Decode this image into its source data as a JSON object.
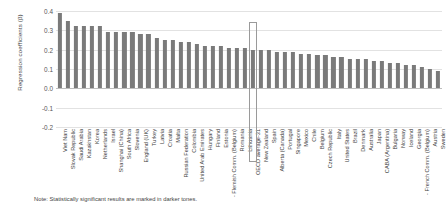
{
  "chart_data": {
    "type": "bar",
    "title": "",
    "xlabel": "",
    "ylabel": "Regression coefficients (β)",
    "ylim": [
      -0.2,
      0.4
    ],
    "ytick_labels": [
      "0.4",
      "0.3",
      "0.2",
      "0.1",
      "0.0",
      "-0.1",
      "-0.2"
    ],
    "ytick_values": [
      0.4,
      0.3,
      0.2,
      0.1,
      0.0,
      -0.1,
      -0.2
    ],
    "grid": true,
    "legend": "none",
    "highlighted_category": "OECD average-31",
    "bar_color": "#7a7a7a",
    "bar_color_light": "#b9b9b9",
    "categories": [
      "Viet Nam",
      "Slovak Republic",
      "Saudi Arabia",
      "Kazakhstan",
      "Korea",
      "Netherlands",
      "Israel",
      "Shanghai (China)",
      "South Africa",
      "Slovenia",
      "England (UK)",
      "Turkey",
      "Latvia",
      "Croatia",
      "Malta",
      "Russian Federation",
      "Colombia",
      "United Arab Emirates",
      "Hungary",
      "Finland",
      "Estonia",
      "- Flemish Comm. (Belgium)",
      "Romania",
      "Lithuania",
      "OECD average-31",
      "New Zealand",
      "Spain",
      "Alberta (Canada)",
      "Portugal",
      "Singapore",
      "Mexico",
      "Chile",
      "Belgium",
      "Czech Republic",
      "Italy",
      "United States",
      "Brazil",
      "Denmark",
      "Australia",
      "Japan",
      "CABA (Argentina)",
      "Bulgaria",
      "Norway",
      "Iceland",
      "Georgia",
      "- French Comm. (Belgium)",
      "Austria",
      "Sweden"
    ],
    "values": [
      0.39,
      0.35,
      0.32,
      0.32,
      0.32,
      0.32,
      0.29,
      0.29,
      0.29,
      0.29,
      0.28,
      0.28,
      0.26,
      0.25,
      0.25,
      0.24,
      0.24,
      0.23,
      0.22,
      0.22,
      0.22,
      0.21,
      0.21,
      0.21,
      0.2,
      0.2,
      0.2,
      0.19,
      0.19,
      0.19,
      0.18,
      0.18,
      0.17,
      0.17,
      0.16,
      0.16,
      0.15,
      0.15,
      0.15,
      0.14,
      0.14,
      0.13,
      0.13,
      0.12,
      0.12,
      0.11,
      0.1,
      0.09
    ],
    "significance": [
      "dark",
      "dark",
      "dark",
      "dark",
      "dark",
      "dark",
      "dark",
      "dark",
      "dark",
      "dark",
      "dark",
      "dark",
      "dark",
      "dark",
      "dark",
      "dark",
      "dark",
      "dark",
      "dark",
      "dark",
      "dark",
      "dark",
      "dark",
      "dark",
      "dark",
      "dark",
      "dark",
      "dark",
      "dark",
      "dark",
      "dark",
      "dark",
      "dark",
      "dark",
      "dark",
      "dark",
      "dark",
      "dark",
      "dark",
      "dark",
      "dark",
      "dark",
      "dark",
      "dark",
      "dark",
      "dark",
      "dark",
      "dark"
    ]
  },
  "note": {
    "text": "Note: Statistically significant results are marked in darker tones."
  }
}
